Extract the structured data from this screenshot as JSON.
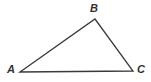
{
  "figure": {
    "name": "triangle-abc",
    "width": 151,
    "height": 82,
    "background_color": "#ffffff",
    "stroke_color": "#3a3a3a",
    "stroke_width": 1.3,
    "label_color": "#303030"
  },
  "vertices": [
    {
      "id": "A",
      "label": "A",
      "x": 20,
      "y": 72,
      "label_x": 7,
      "label_y": 64
    },
    {
      "id": "B",
      "label": "B",
      "x": 95,
      "y": 19,
      "label_x": 90,
      "label_y": 3
    },
    {
      "id": "C",
      "label": "C",
      "x": 133,
      "y": 71,
      "label_x": 137,
      "label_y": 64
    }
  ],
  "edges": [
    {
      "id": "AB",
      "from": "A",
      "to": "B"
    },
    {
      "id": "BC",
      "from": "B",
      "to": "C"
    },
    {
      "id": "CA",
      "from": "C",
      "to": "A"
    }
  ],
  "chart_data": {
    "type": "scatter",
    "title": "",
    "xlabel": "",
    "ylabel": "",
    "points": [
      {
        "label": "A",
        "x": 20,
        "y": 72
      },
      {
        "label": "B",
        "x": 95,
        "y": 19
      },
      {
        "label": "C",
        "x": 133,
        "y": 71
      }
    ],
    "polyline": [
      [
        20,
        72
      ],
      [
        95,
        19
      ],
      [
        133,
        71
      ],
      [
        20,
        72
      ]
    ],
    "grid": false,
    "legend": "none"
  }
}
